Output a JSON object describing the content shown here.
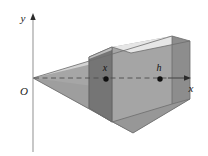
{
  "figure": {
    "width": 208,
    "height": 156,
    "background": "#ffffff"
  },
  "axes": {
    "x_axis": {
      "label": "x",
      "label_pos": {
        "x": 191,
        "y": 91
      },
      "line": {
        "x1": 33,
        "y1": 78,
        "x2": 190,
        "y2": 78
      },
      "arrow": true,
      "color": "#555555"
    },
    "y_axis": {
      "label": "y",
      "label_pos": {
        "x": 24,
        "y": 21
      },
      "line": {
        "x1": 33,
        "y1": 150,
        "x2": 33,
        "y2": 16
      },
      "arrow": true,
      "color": "#8a8a8a"
    },
    "origin": {
      "label": "O",
      "label_pos": {
        "x": 24,
        "y": 94
      },
      "point": {
        "x": 33,
        "y": 78
      }
    }
  },
  "markers": [
    {
      "name": "x-marker",
      "label": "x",
      "label_pos": {
        "x": 104,
        "y": 71
      },
      "dot": {
        "x": 106,
        "y": 79,
        "r": 2.6
      }
    },
    {
      "name": "h-marker",
      "label": "h",
      "label_pos": {
        "x": 157,
        "y": 71
      },
      "dot": {
        "x": 160,
        "y": 79,
        "r": 2.6
      }
    }
  ],
  "solid": {
    "name": "wedge",
    "apex": {
      "x": 33,
      "y": 78
    },
    "colors": {
      "front_face": "#9d9d9d",
      "top_face": "#d8d8d8",
      "top_face_light": "#e8e8e8",
      "bottom_left_face": "#9a9a9a",
      "bottom_front_face": "#a8a8a8",
      "cross_section": "#6f6f6f",
      "cross_section_side": "#8c8c8c",
      "upper_wedge": "#c4c4c4",
      "outline": "#6a6a6a",
      "dashed": "#5a5a5a"
    },
    "faces": [
      {
        "name": "upper-left-wedge",
        "points": "33,78 172,36 172,44 33,79",
        "fill": "#c9c9c9"
      },
      {
        "name": "lower-left-wedge",
        "points": "33,78 160,118 172,104 172,44",
        "fill": "#a0a0a0"
      },
      {
        "name": "top-face",
        "points": "172,36 190,42 178,50 160,44",
        "fill": "#e4e4e4"
      },
      {
        "name": "front-face",
        "points": "112,47 172,36 172,104 112,121",
        "fill": "#a3a3a3"
      },
      {
        "name": "right-face",
        "points": "172,36 190,42 190,99 172,104",
        "fill": "#8f8f8f"
      },
      {
        "name": "bottom-face",
        "points": "112,121 172,104 190,99 133,132",
        "fill": "#949494"
      },
      {
        "name": "cross-section-plane",
        "points": "89,56 112,47 112,121 89,108",
        "fill": "#707070"
      }
    ],
    "dashed_line": {
      "x1": 36,
      "y1": 78,
      "x2": 160,
      "y2": 78
    }
  }
}
